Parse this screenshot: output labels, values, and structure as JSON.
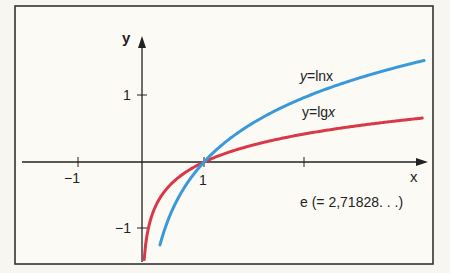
{
  "chart_data": {
    "type": "line",
    "title": "",
    "xlabel": "x",
    "ylabel": "y",
    "xlim": [
      -1.95,
      4.6
    ],
    "ylim": [
      -1.5,
      2.0
    ],
    "x_ticks": [
      {
        "value": -1,
        "label": "−1"
      },
      {
        "value": 1,
        "label": "1"
      },
      {
        "value": 2.71828,
        "label": ""
      }
    ],
    "y_ticks": [
      {
        "value": 1,
        "label": "1"
      },
      {
        "value": -1,
        "label": "−1"
      }
    ],
    "grid": false,
    "series": [
      {
        "name": "y=lnx",
        "color": "#3a9ad9",
        "function": "ln(x)",
        "x": [
          0.3,
          0.5,
          1,
          2,
          2.71828,
          3.5,
          4.5
        ],
        "y": [
          -1.204,
          -0.693,
          0,
          0.693,
          1,
          1.253,
          1.504
        ]
      },
      {
        "name": "y=lgx",
        "color": "#d93848",
        "function": "log10(x)",
        "x": [
          0.05,
          0.1,
          0.5,
          1,
          2,
          2.71828,
          3.5,
          4.5
        ],
        "y": [
          -1.301,
          -1,
          -0.301,
          0,
          0.301,
          0.434,
          0.544,
          0.653
        ]
      }
    ],
    "annotations": [
      {
        "text": "y=lnx",
        "near_series": "y=lnx"
      },
      {
        "text": "y=lgx",
        "near_series": "y=lgx"
      },
      {
        "text": "e (= 2,71828. . .)",
        "x": 2.71828
      }
    ]
  },
  "labels": {
    "y_axis": "y",
    "x_axis": "x",
    "tick_y_pos1": "1",
    "tick_y_neg1": "−1",
    "tick_x_neg1": "−1",
    "tick_x_pos1": "1",
    "ln_label_prefix": "y",
    "ln_label_rest": "=lnx",
    "lg_label": "y=lg",
    "lg_label_x": "x",
    "e_label": "e (= 2,71828. . .)"
  }
}
